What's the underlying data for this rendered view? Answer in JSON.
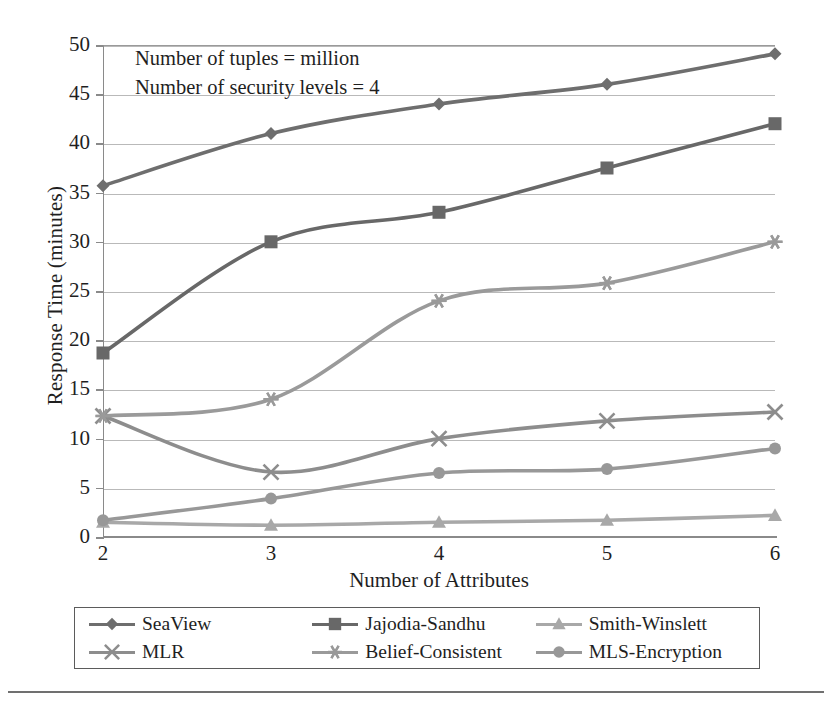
{
  "chart_data": {
    "type": "line",
    "title": "",
    "xlabel": "Number of Attributes",
    "ylabel": "Response Time (minutes)",
    "x": [
      2,
      3,
      4,
      5,
      6
    ],
    "xticklabels": [
      "2",
      "3",
      "4",
      "5",
      "6"
    ],
    "yticklabels": [
      "0",
      "5",
      "10",
      "15",
      "20",
      "25",
      "30",
      "35",
      "40",
      "45",
      "50"
    ],
    "yticks": [
      0,
      5,
      10,
      15,
      20,
      25,
      30,
      35,
      40,
      45,
      50
    ],
    "xlim": [
      2,
      6
    ],
    "ylim": [
      0,
      50
    ],
    "grid": true,
    "legend_position": "bottom",
    "legend_columns": 3,
    "annotations": [
      "Number of tuples = million",
      "Number of security levels = 4"
    ],
    "series": [
      {
        "name": "SeaView",
        "marker": "diamond",
        "color": "#6e6e6e",
        "values": [
          35.7,
          41.0,
          44.0,
          46.0,
          49.1
        ]
      },
      {
        "name": "Jajodia-Sandhu",
        "marker": "square",
        "color": "#686868",
        "values": [
          18.7,
          30.0,
          33.0,
          37.5,
          42.0
        ]
      },
      {
        "name": "Smith-Winslett",
        "marker": "triangle",
        "color": "#a8a8a8",
        "values": [
          1.5,
          1.2,
          1.5,
          1.7,
          2.2
        ]
      },
      {
        "name": "MLR",
        "marker": "cross",
        "color": "#8d8d8d",
        "values": [
          12.3,
          6.6,
          10.0,
          11.8,
          12.7
        ]
      },
      {
        "name": "Belief-Consistent",
        "marker": "asterisk",
        "color": "#9a9a9a",
        "values": [
          12.3,
          14.0,
          24.0,
          25.8,
          30.0
        ]
      },
      {
        "name": "MLS-Encryption",
        "marker": "circle",
        "color": "#989898",
        "values": [
          1.7,
          3.9,
          6.5,
          6.9,
          9.0
        ]
      }
    ]
  },
  "axis": {
    "y_title": "Response Time (minutes)",
    "x_title": "Number of Attributes",
    "y_labels": [
      "50",
      "45",
      "40",
      "35",
      "30",
      "25",
      "20",
      "15",
      "10",
      "5",
      "0"
    ],
    "x_labels": [
      "2",
      "3",
      "4",
      "5",
      "6"
    ]
  },
  "annotation": {
    "line1": "Number of tuples = million",
    "line2": "Number of security levels = 4"
  },
  "legend": {
    "items": [
      {
        "label": "SeaView",
        "marker": "diamond-marker-icon",
        "color": "#6e6e6e"
      },
      {
        "label": "Jajodia-Sandhu",
        "marker": "square-marker-icon",
        "color": "#686868"
      },
      {
        "label": "Smith-Winslett",
        "marker": "triangle-marker-icon",
        "color": "#a8a8a8"
      },
      {
        "label": "MLR",
        "marker": "cross-marker-icon",
        "color": "#8d8d8d"
      },
      {
        "label": "Belief-Consistent",
        "marker": "asterisk-marker-icon",
        "color": "#9a9a9a"
      },
      {
        "label": "MLS-Encryption",
        "marker": "circle-marker-icon",
        "color": "#989898"
      }
    ]
  },
  "colors": {
    "grid": "#b9b9b9",
    "axis": "#8a8a8a",
    "text": "#1f1f1f",
    "legend_border": "#5b5b5b",
    "bottom_rule": "#707070"
  }
}
